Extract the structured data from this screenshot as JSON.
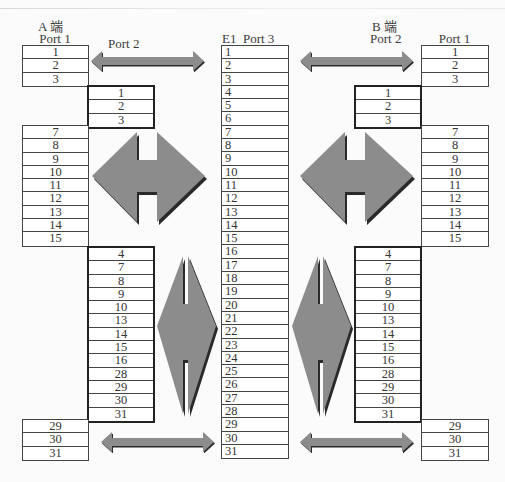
{
  "a_end": {
    "title": "A 端",
    "port1_label": "Port 1",
    "port2_label": "Port 2",
    "port1_top": [
      "1",
      "2",
      "3"
    ],
    "port2_top": [
      "1",
      "2",
      "3"
    ],
    "port1_mid": [
      "7",
      "8",
      "9",
      "10",
      "11",
      "12",
      "13",
      "14",
      "15"
    ],
    "port2_bottom": [
      "4",
      "7",
      "8",
      "9",
      "10",
      "13",
      "14",
      "15",
      "16",
      "28",
      "29",
      "30",
      "31"
    ],
    "port1_bottom": [
      "29",
      "30",
      "31"
    ]
  },
  "e1": {
    "label": "E1  Port 3",
    "timeslots": [
      "1",
      "2",
      "3",
      "4",
      "5",
      "6",
      "7",
      "8",
      "9",
      "10",
      "11",
      "12",
      "13",
      "14",
      "15",
      "16",
      "17",
      "18",
      "19",
      "20",
      "21",
      "22",
      "23",
      "24",
      "25",
      "26",
      "27",
      "28",
      "29",
      "30",
      "31"
    ]
  },
  "b_end": {
    "title": "B 端",
    "port2_label": "Port 2",
    "port1_label": "Port 1",
    "port1_top": [
      "1",
      "2",
      "3"
    ],
    "port2_top": [
      "1",
      "2",
      "3"
    ],
    "port1_mid": [
      "7",
      "8",
      "9",
      "10",
      "11",
      "12",
      "13",
      "14",
      "15"
    ],
    "port2_bottom": [
      "4",
      "7",
      "8",
      "9",
      "10",
      "13",
      "14",
      "15",
      "16",
      "28",
      "29",
      "30",
      "31"
    ],
    "port1_bottom": [
      "29",
      "30",
      "31"
    ]
  },
  "colors": {
    "arrow_fill": "#8c8c8c",
    "arrow_shadow": "#2a2a2a",
    "border": "#444444"
  },
  "icons": {
    "horizontal_arrow": "double-headed-arrow-horizontal",
    "diamond_arrow": "bidirectional-diamond-arrow"
  }
}
